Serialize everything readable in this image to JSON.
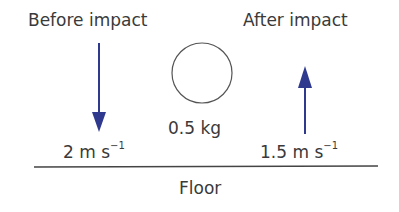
{
  "labels": {
    "before": "Before impact",
    "after": "After impact",
    "mass": "0.5 kg",
    "velocity_before_value": "2 m s",
    "velocity_before_exp": "−1",
    "velocity_after_value": "1.5 m s",
    "velocity_after_exp": "−1",
    "floor": "Floor"
  },
  "colors": {
    "arrow": "#2f3a8f",
    "text": "#3a3a3a",
    "line": "#444444"
  }
}
